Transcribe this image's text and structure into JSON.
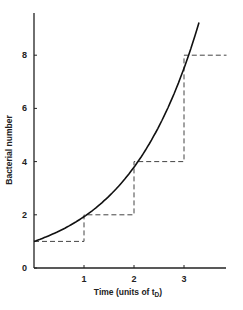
{
  "chart_data": {
    "type": "line",
    "title": "",
    "xlabel": "Time (units of t",
    "xlabel_sub": "D",
    "xlabel_close": ")",
    "ylabel": "Bacterial number",
    "x_ticks": [
      "1",
      "2",
      "3"
    ],
    "y_ticks": [
      "0",
      "2",
      "4",
      "6",
      "8"
    ],
    "xlim": [
      0,
      3.9
    ],
    "ylim": [
      0,
      9.6
    ],
    "grid": false,
    "legend": null,
    "series": [
      {
        "name": "continuous exponential growth",
        "style": "solid",
        "x": [
          0,
          0.5,
          1,
          1.5,
          2,
          2.5,
          3,
          3.3
        ],
        "y": [
          1,
          1.41,
          2,
          2.83,
          4,
          5.66,
          8,
          9.85
        ]
      },
      {
        "name": "synchronous doubling (step)",
        "style": "dashed",
        "x": [
          0,
          1,
          1,
          2,
          2,
          3,
          3,
          3.85
        ],
        "y": [
          1,
          1,
          2,
          2,
          4,
          4,
          8,
          8
        ]
      }
    ]
  }
}
